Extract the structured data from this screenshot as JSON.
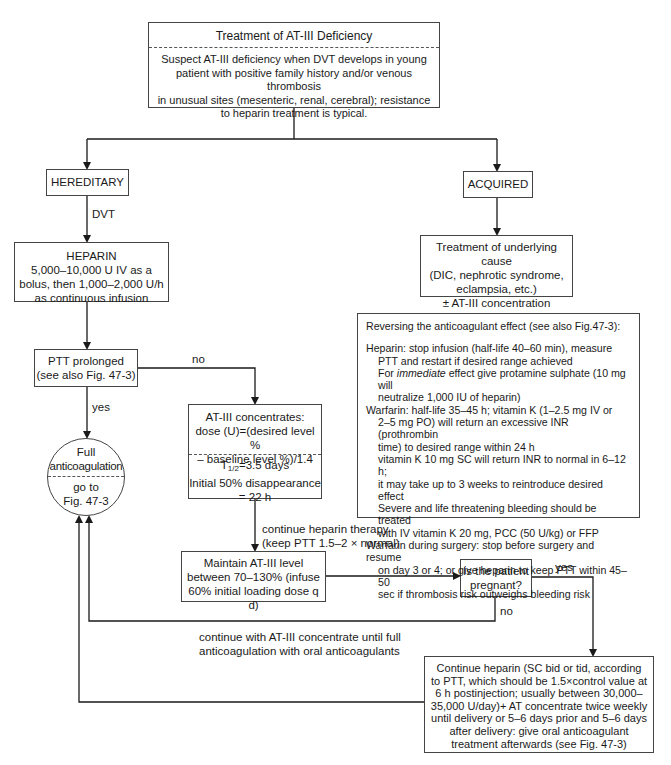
{
  "title_box": {
    "title": "Treatment of AT-III Deficiency",
    "lines": [
      "Suspect AT-III deficiency when DVT develops in young",
      "patient with positive family history and/or venous thrombosis",
      "in unusual sites (mesenteric, renal, cerebral); resistance",
      "to heparin treatment is typical."
    ]
  },
  "hereditary": {
    "label": "HEREDITARY"
  },
  "acquired": {
    "label": "ACQUIRED"
  },
  "edge_labels": {
    "dvt": "DVT",
    "no_ptt": "no",
    "yes_ptt": "yes",
    "continue_heparin_1": "continue heparin therapy",
    "continue_heparin_2": "(keep PTT 1.5–2 × normal)",
    "yes_pregnant": "yes",
    "no_pregnant": "no",
    "continue_at3_1": "continue with AT-III concentrate until full",
    "continue_at3_2": "anticoagulation with oral anticoagulants"
  },
  "heparin_box": {
    "title": "HEPARIN",
    "lines": [
      "5,000–10,000 U IV as a",
      "bolus, then 1,000–2,000 U/h",
      "as continuous infusion"
    ]
  },
  "underlying_box": {
    "lines": [
      "Treatment of underlying cause",
      "(DIC, nephrotic syndrome,",
      "eclampsia, etc.)",
      "± AT-III concentration"
    ]
  },
  "ptt_box": {
    "lines": [
      "PTT prolonged",
      "(see also Fig. 47-3)"
    ]
  },
  "full_anticoag": {
    "top": [
      "Full",
      "anticoagulation"
    ],
    "bottom": [
      "go to",
      "Fig. 47-3"
    ]
  },
  "at3_box": {
    "top": [
      "AT-III concentrates:",
      "dose (U)=(desired level %",
      "– baseline level %)/1.4"
    ],
    "t_half_prefix": "T",
    "t_half_sub": "1/2",
    "t_half_rest": "=3.5 days",
    "bottom": [
      "Initial 50% disappearance",
      "= 22 h"
    ]
  },
  "maintain_box": {
    "lines": [
      "Maintain AT-III level",
      "between 70–130% (infuse",
      "60% initial loading dose q d)"
    ]
  },
  "pregnant_box": {
    "lines": [
      "Is the patient",
      "pregnant?"
    ]
  },
  "continue_box": {
    "lines": [
      "Continue heparin (SC bid or tid, according",
      "to PTT, which should be 1.5×control value at",
      "6 h postinjection; usually between 30,000–",
      "35,000 U/day)+ AT concentrate twice weekly",
      "until delivery or 5–6 days prior and 5–6 days",
      "after delivery: give oral anticoagulant",
      "treatment afterwards (see Fig. 47-3)"
    ]
  },
  "reversing_box": {
    "heading": "Reversing the anticoagulant effect (see also Fig.47-3):",
    "heparin_1": "Heparin: stop infusion (half-life 40–60 min), measure",
    "heparin_2": "PTT and restart if desired range achieved",
    "heparin_3_pre": "For ",
    "heparin_3_em": "immediate",
    "heparin_3_post": " effect give protamine sulphate (10 mg will",
    "heparin_4": "neutralize 1,000 IU of heparin)",
    "warfarin_1": "Warfarin:  half-life 35–45 h; vitamin K (1–2.5 mg IV or",
    "warfarin_2": "2–5 mg PO) will return an excessive INR (prothrombin",
    "warfarin_3": "time) to desired range within 24 h",
    "warfarin_4": "vitamin K 10 mg SC will return INR to normal in 6–12 h;",
    "warfarin_5": "it may take up to 3 weeks to reintroduce desired effect",
    "warfarin_6": "Severe and life threatening bleeding should be treated",
    "warfarin_7": "with IV vitamin K 20 mg, PCC (50 U/kg) or FFP",
    "surgery_1": "Warfarin during surgery: stop before surgery and resume",
    "surgery_2": "on day 3 or 4; or give heparin to keep PTT within 45–50",
    "surgery_3": "sec if thrombosis risk outweighs bleeding risk"
  }
}
